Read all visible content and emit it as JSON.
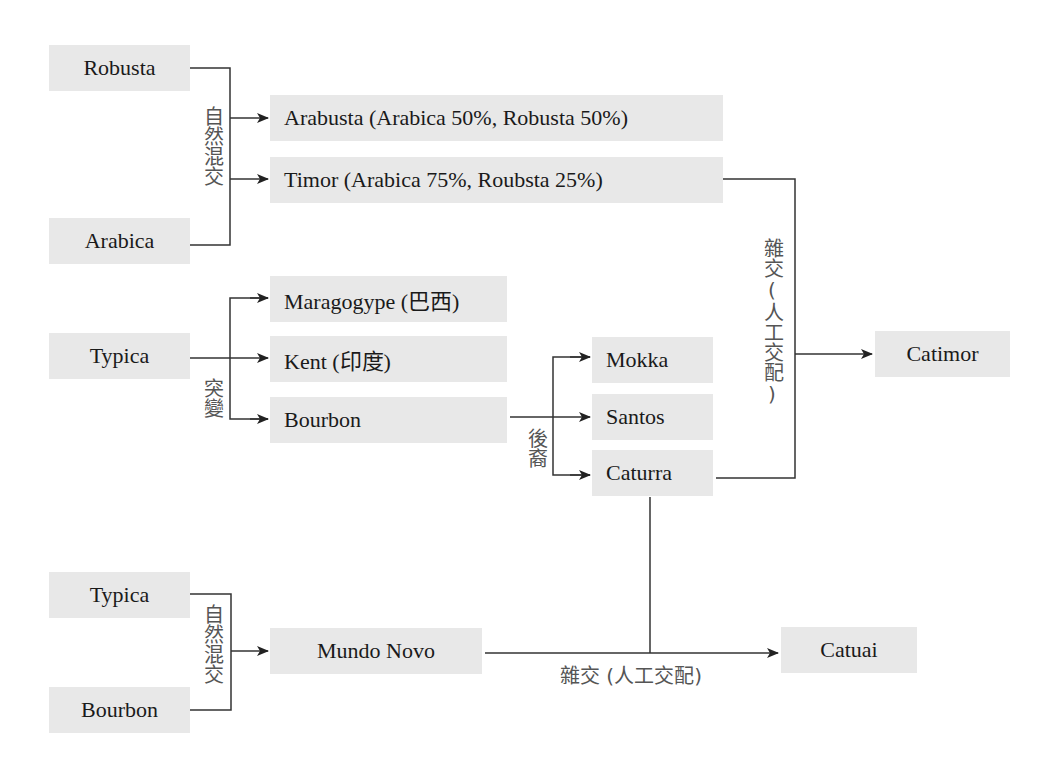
{
  "diagram": {
    "type": "coffee-variety-lineage",
    "colors": {
      "node_fill": "#e8e8e8",
      "line": "#333333",
      "label_text": "#555555",
      "node_text": "#1a1a1a"
    },
    "nodes": {
      "robusta": "Robusta",
      "arabica": "Arabica",
      "arabusta": "Arabusta (Arabica 50%, Robusta 50%)",
      "timor": "Timor (Arabica 75%, Roubsta 25%)",
      "typica_1": "Typica",
      "maragogype": "Maragogype (巴西)",
      "kent": "Kent (印度)",
      "bourbon_1": "Bourbon",
      "mokka": "Mokka",
      "santos": "Santos",
      "caturra": "Caturra",
      "catimor": "Catimor",
      "typica_2": "Typica",
      "bourbon_2": "Bourbon",
      "mundo_novo": "Mundo Novo",
      "catuai": "Catuai"
    },
    "edge_labels": {
      "natural_cross_top": "自然混交",
      "mutation": "突變",
      "descendant": "後裔",
      "artificial_cross_vertical": "雜交(人工交配)",
      "natural_cross_bottom": "自然混交",
      "artificial_cross_horizontal": "雜交 (人工交配)"
    },
    "edges": [
      {
        "from": [
          "Robusta",
          "Arabica"
        ],
        "to": "Arabusta (Arabica 50%, Robusta 50%)",
        "label": "自然混交"
      },
      {
        "from": [
          "Robusta",
          "Arabica"
        ],
        "to": "Timor (Arabica 75%, Roubsta 25%)",
        "label": "自然混交"
      },
      {
        "from": [
          "Typica"
        ],
        "to": "Maragogype (巴西)",
        "label": "突變"
      },
      {
        "from": [
          "Typica"
        ],
        "to": "Kent (印度)",
        "label": "突變"
      },
      {
        "from": [
          "Typica"
        ],
        "to": "Bourbon",
        "label": "突變"
      },
      {
        "from": [
          "Bourbon"
        ],
        "to": "Mokka",
        "label": "後裔"
      },
      {
        "from": [
          "Bourbon"
        ],
        "to": "Santos",
        "label": "後裔"
      },
      {
        "from": [
          "Bourbon"
        ],
        "to": "Caturra",
        "label": "後裔"
      },
      {
        "from": [
          "Timor (Arabica 75%, Roubsta 25%)",
          "Caturra"
        ],
        "to": "Catimor",
        "label": "雜交(人工交配)"
      },
      {
        "from": [
          "Typica",
          "Bourbon"
        ],
        "to": "Mundo Novo",
        "label": "自然混交"
      },
      {
        "from": [
          "Mundo Novo",
          "Caturra"
        ],
        "to": "Catuai",
        "label": "雜交 (人工交配)"
      }
    ]
  }
}
